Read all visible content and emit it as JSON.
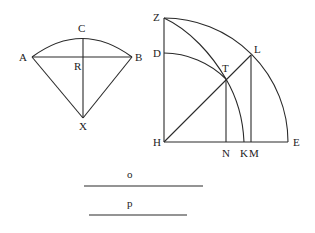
{
  "diagram": {
    "left_figure": {
      "labels": {
        "A": "A",
        "B": "B",
        "C": "C",
        "R": "R",
        "X": "X"
      },
      "points": {
        "A": [
          32,
          57
        ],
        "B": [
          132,
          57
        ],
        "C": [
          83,
          38
        ],
        "R": [
          83,
          57
        ],
        "X": [
          83,
          118
        ]
      }
    },
    "right_figure": {
      "labels": {
        "Z": "Z",
        "D": "D",
        "L": "L",
        "T": "T",
        "H": "H",
        "N": "N",
        "K": "K",
        "M": "M",
        "E": "E"
      },
      "points": {
        "Z": [
          164,
          18
        ],
        "D": [
          164,
          53
        ],
        "L": [
          251,
          55
        ],
        "T": [
          226,
          79
        ],
        "H": [
          164,
          142
        ],
        "N": [
          226,
          142
        ],
        "K": [
          244,
          142
        ],
        "M": [
          251,
          142
        ],
        "E": [
          288,
          142
        ]
      }
    },
    "segments": {
      "o": {
        "label": "o",
        "from": [
          84,
          186
        ],
        "to": [
          203,
          186
        ]
      },
      "p": {
        "label": "p",
        "from": [
          89,
          215
        ],
        "to": [
          187,
          215
        ]
      }
    }
  }
}
